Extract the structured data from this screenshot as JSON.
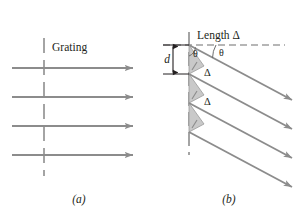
{
  "figure": {
    "panels": [
      {
        "id": "a",
        "caption": "(a)",
        "grating_label": "Grating",
        "ray_count": 4,
        "ray_direction": "horizontal-right",
        "description": "Plane wavefronts arriving at the grating"
      },
      {
        "id": "b",
        "caption": "(b)",
        "length_label": "Length  Δ",
        "spacing_label": "d",
        "angle_label_inner": "θ",
        "angle_label_outer": "θ",
        "path_difference_labels": [
          "Δ",
          "Δ"
        ],
        "ray_count": 4,
        "ray_direction": "diagonal-down-right",
        "description": "Diffracted rays leaving the grating at angle theta with path difference Delta"
      }
    ],
    "colors": {
      "ray": "#8c8c8c",
      "arrowhead": "#8c8c8c",
      "grating_line": "#6e6e6e",
      "dashed_reference": "#6e6e6e",
      "triangle_fill": "#c9c9c9",
      "triangle_stroke": "#8c8c8c",
      "text": "#231f20",
      "background": "#ffffff"
    },
    "geometry": {
      "panel_a_grating_x": 44,
      "panel_a_ray_y": [
        68,
        97,
        126,
        155
      ],
      "panel_a_ray_x_start": 12,
      "panel_a_ray_x_end": 136,
      "panel_b_grating_x": 189,
      "panel_b_ray_origin_y": [
        45,
        74,
        103,
        132
      ],
      "panel_b_ray_end_x": 295,
      "panel_b_dashed_y": 45,
      "panel_b_dashed_x_end": 285,
      "panel_b_ray_slope_deg": 28
    }
  }
}
